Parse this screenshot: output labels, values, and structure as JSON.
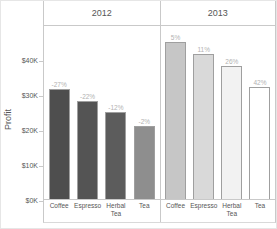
{
  "chart_data": {
    "type": "bar",
    "title": "",
    "ylabel": "Profit",
    "categories": [
      "Coffee",
      "Espresso",
      "Herbal Tea",
      "Tea"
    ],
    "y_ticks": [
      {
        "label": "$40K",
        "value": 40000
      },
      {
        "label": "$30K",
        "value": 30000
      },
      {
        "label": "$20K",
        "value": 20000
      },
      {
        "label": "$10K",
        "value": 10000
      },
      {
        "label": "$0K",
        "value": 0
      }
    ],
    "ylim": [
      0,
      50000
    ],
    "grid": false,
    "legend": false,
    "panels": [
      {
        "year": "2012",
        "values": [
          31500,
          28000,
          25000,
          21000
        ],
        "change_labels": [
          "-27%",
          "-22%",
          "-12%",
          "-2%"
        ],
        "bar_colors": [
          "#4e4e4e",
          "#545454",
          "#5c5c5c",
          "#8e8e8e"
        ]
      },
      {
        "year": "2013",
        "values": [
          45000,
          41500,
          38000,
          32000
        ],
        "change_labels": [
          "5%",
          "11%",
          "26%",
          "42%"
        ],
        "bar_colors": [
          "#c6c6c6",
          "#d9d9d9",
          "#f2f2f2",
          "#ffffff"
        ]
      }
    ],
    "colors": {
      "axis": "#c9c9c9",
      "bar_border": "#9f9f9f",
      "change_label": "#b2b2b2",
      "text": "#565656"
    }
  }
}
